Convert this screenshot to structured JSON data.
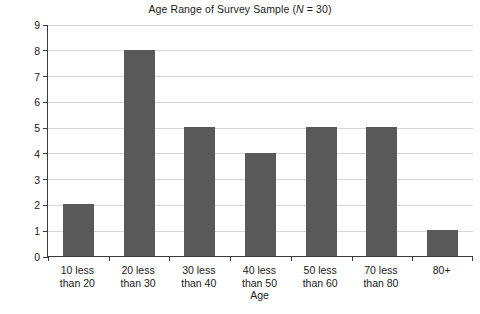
{
  "chart_data": {
    "type": "bar",
    "title": "Age Range of Survey Sample (N = 30)",
    "title_prefix": "Age Range of Survey Sample (",
    "title_italic": "N",
    "title_suffix": " = 30)",
    "xlabel": "Age",
    "ylabel": "Number of people",
    "categories": [
      "10 less\nthan 20",
      "20 less\nthan 30",
      "30 less\nthan 40",
      "40 less\nthan 50",
      "50 less\nthan 60",
      "70 less\nthan 80",
      "80+"
    ],
    "values": [
      2,
      8,
      5,
      4,
      5,
      5,
      1
    ],
    "ylim": [
      0,
      9
    ],
    "ytick_labels": [
      "0",
      "1",
      "2",
      "3",
      "4",
      "5",
      "6",
      "7",
      "8",
      "9"
    ],
    "ytick_values": [
      0,
      1,
      2,
      3,
      4,
      5,
      6,
      7,
      8,
      9
    ],
    "grid": true,
    "legend": false,
    "sample_size": 30,
    "bar_color": "#595959",
    "gridline_color": "#d6d6d6",
    "axis_color": "#3b3b3b",
    "background_color": "#ffffff",
    "text_color": "#1a1a1a"
  }
}
